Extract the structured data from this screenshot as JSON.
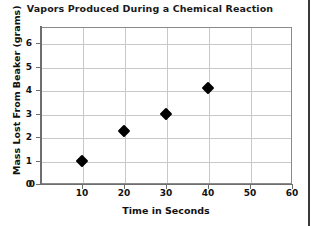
{
  "chart_data": {
    "type": "scatter",
    "title": "Vapors Produced During a Chemical Reaction",
    "xlabel": "Time in Seconds",
    "ylabel": "Mass Lost From Beaker (grams)",
    "xlim": [
      0,
      60
    ],
    "ylim": [
      0,
      6.7
    ],
    "xticks": [
      0,
      10,
      20,
      30,
      40,
      50,
      60
    ],
    "xtick_labels": [
      "0",
      "10",
      "20",
      "30",
      "40",
      "50",
      "60"
    ],
    "yticks": [
      0,
      1,
      2,
      3,
      4,
      5,
      6
    ],
    "ytick_labels": [
      "0",
      "1",
      "2",
      "3",
      "4",
      "5",
      "6"
    ],
    "grid": true,
    "grid_color": "#c8c8c8",
    "legend": null,
    "marker_style": "filled-diamond",
    "marker_color": "#000000",
    "series": [
      {
        "name": "Mass Lost From Beaker",
        "points": [
          {
            "x": 10,
            "y": 1.0
          },
          {
            "x": 20,
            "y": 2.25
          },
          {
            "x": 30,
            "y": 3.0
          },
          {
            "x": 40,
            "y": 4.1
          }
        ]
      }
    ]
  }
}
